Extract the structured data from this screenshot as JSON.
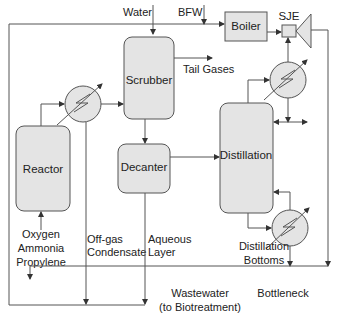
{
  "diagram": {
    "type": "process-flow",
    "units": {
      "scrubber": "Scrubber",
      "reactor": "Reactor",
      "decanter": "Decanter",
      "distillation": "Distillation",
      "boiler": "Boiler",
      "sje": "SJE"
    },
    "streams": {
      "water": "Water",
      "bfw": "BFW",
      "tail_gases": "Tail Gases",
      "feed_line1": "Oxygen",
      "feed_line2": "Ammonia",
      "feed_line3": "Propylene",
      "offgas_line1": "Off-gas",
      "offgas_line2": "Condensate",
      "aqueous_line1": "Aqueous",
      "aqueous_line2": "Layer",
      "bottoms_line1": "Distillation",
      "bottoms_line2": "Bottoms",
      "wastewater_line1": "Wastewater",
      "wastewater_line2": "(to Biotreatment)",
      "bottleneck": "Bottleneck"
    },
    "colors": {
      "unit_fill": "#e4e4e4",
      "stroke": "#555555",
      "text": "#222222"
    }
  }
}
